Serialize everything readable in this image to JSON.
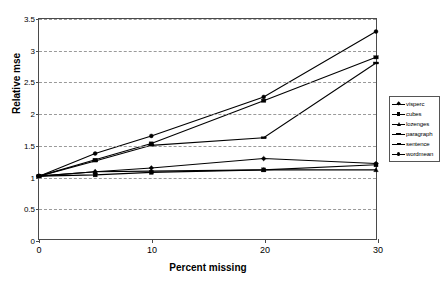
{
  "chart_data": {
    "type": "line",
    "title": "",
    "xlabel": "Percent missing",
    "ylabel": "Relative mse",
    "x": [
      0,
      5,
      10,
      20,
      30
    ],
    "xlim": [
      0,
      30
    ],
    "ylim": [
      0,
      3.5
    ],
    "xticks": [
      "0",
      "10",
      "20",
      "30"
    ],
    "xtick_values": [
      0,
      10,
      20,
      30
    ],
    "yticks": [
      "0",
      "0.5",
      "1",
      "1.5",
      "2",
      "2.5",
      "3",
      "3.5"
    ],
    "ytick_values": [
      0,
      0.5,
      1,
      1.5,
      2,
      2.5,
      3,
      3.5
    ],
    "grid": "horizontal-dashed",
    "legend_position": "right",
    "series": [
      {
        "name": "visperc",
        "marker": "diamond",
        "values": [
          1.0,
          1.07,
          1.13,
          1.28,
          1.2
        ]
      },
      {
        "name": "cubes",
        "marker": "square",
        "values": [
          1.0,
          1.02,
          1.06,
          1.1,
          1.18
        ]
      },
      {
        "name": "lozenges",
        "marker": "triangle",
        "values": [
          1.0,
          1.07,
          1.08,
          1.1,
          1.1
        ]
      },
      {
        "name": "paragraph",
        "marker": "cross",
        "values": [
          1.0,
          1.24,
          1.49,
          1.61,
          2.8
        ]
      },
      {
        "name": "sentence",
        "marker": "dash",
        "values": [
          1.0,
          1.26,
          1.52,
          2.2,
          2.89
        ]
      },
      {
        "name": "wordmean",
        "marker": "circle",
        "values": [
          1.0,
          1.36,
          1.64,
          2.26,
          3.3
        ]
      }
    ]
  },
  "axes": {
    "x_title": "Percent missing",
    "y_title": "Relative mse"
  },
  "legend": {
    "entries": [
      "visperc",
      "cubes",
      "lozenges",
      "paragraph",
      "sentence",
      "wordmean"
    ]
  },
  "colors": {
    "series": "#000000",
    "grid": "#9a9a9a",
    "axis": "#4a4a4a",
    "background": "#ffffff"
  }
}
